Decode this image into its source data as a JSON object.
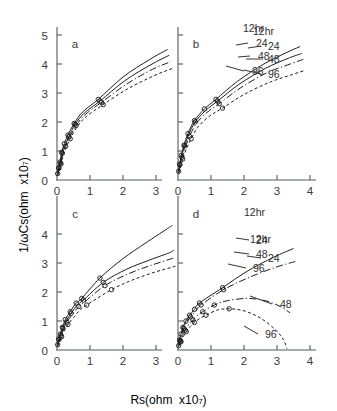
{
  "figure": {
    "title": "",
    "xlabel_parts": {
      "main": "Rs(ohm  x10",
      "exp": "7",
      "close": ")"
    },
    "ylabel_parts": {
      "main": "1/ωCs(ohm  x10",
      "exp": "7",
      "close": ")"
    },
    "panels": [
      {
        "id": "a",
        "letter": "a"
      },
      {
        "id": "b",
        "letter": "b"
      },
      {
        "id": "c",
        "letter": "c"
      },
      {
        "id": "d",
        "letter": "d"
      }
    ],
    "series_labels": [
      "12hr",
      "24",
      "48",
      "96"
    ],
    "xticks_top_left": [
      "0",
      "1",
      "2",
      "3"
    ],
    "xticks_top_right": [
      "0",
      "1",
      "2",
      "3",
      "4"
    ],
    "xticks_bottom_left": [
      "0",
      "1",
      "2",
      "3"
    ],
    "xticks_bottom_right": [
      "0",
      "1",
      "2",
      "3",
      "4"
    ],
    "yticks_top": [
      "0",
      "1",
      "2",
      "3",
      "4",
      "5"
    ],
    "yticks_bottom": [
      "0",
      "1",
      "2",
      "3",
      "4"
    ]
  },
  "chart_data": {
    "type": "line",
    "title": "",
    "xlabel": "Rs(ohm x10^7)",
    "ylabel": "1/ωCs(ohm x10^7)",
    "grid": false,
    "legend_position": "inline-right-of-curves",
    "subplots": [
      {
        "panel": "a",
        "xlim": [
          0,
          3.6
        ],
        "ylim": [
          0,
          5
        ],
        "series": [
          {
            "name": "12hr",
            "style": "solid",
            "x": [
              0.02,
              0.05,
              0.09,
              0.14,
              0.22,
              0.33,
              0.52,
              0.78,
              1.25,
              2.0,
              2.8,
              3.35
            ],
            "y": [
              0.22,
              0.42,
              0.62,
              0.95,
              1.25,
              1.55,
              1.95,
              2.35,
              2.78,
              3.55,
              4.15,
              4.5
            ],
            "markers_x": [
              0.02,
              0.05,
              0.09,
              0.14,
              0.22,
              0.33,
              0.52,
              1.25
            ],
            "markers_y": [
              0.22,
              0.42,
              0.62,
              0.95,
              1.25,
              1.55,
              1.95,
              2.78
            ]
          },
          {
            "name": "24",
            "style": "solid",
            "x": [
              0.02,
              0.06,
              0.1,
              0.16,
              0.25,
              0.36,
              0.55,
              0.82,
              1.3,
              2.05,
              2.85,
              3.4
            ],
            "y": [
              0.2,
              0.4,
              0.6,
              0.92,
              1.2,
              1.5,
              1.92,
              2.3,
              2.72,
              3.42,
              3.98,
              4.3
            ],
            "markers_x": [
              0.06,
              0.16,
              0.36,
              0.55,
              1.3
            ],
            "markers_y": [
              0.4,
              0.92,
              1.5,
              1.92,
              2.72
            ]
          },
          {
            "name": "48",
            "style": "dashdot",
            "x": [
              0.02,
              0.06,
              0.11,
              0.17,
              0.26,
              0.38,
              0.58,
              0.85,
              1.35,
              2.1,
              2.9,
              3.45
            ],
            "y": [
              0.18,
              0.38,
              0.58,
              0.88,
              1.16,
              1.46,
              1.88,
              2.25,
              2.68,
              3.3,
              3.82,
              4.08
            ],
            "markers_x": [
              0.11,
              0.26,
              0.58,
              1.35
            ],
            "markers_y": [
              0.58,
              1.16,
              1.88,
              2.68
            ]
          },
          {
            "name": "96",
            "style": "dash",
            "x": [
              0.02,
              0.07,
              0.12,
              0.19,
              0.28,
              0.4,
              0.6,
              0.88,
              1.4,
              2.15,
              2.95,
              3.5
            ],
            "y": [
              0.16,
              0.35,
              0.55,
              0.85,
              1.12,
              1.42,
              1.82,
              2.18,
              2.6,
              3.15,
              3.6,
              3.85
            ],
            "markers_x": [
              0.12,
              0.4,
              1.4
            ],
            "markers_y": [
              0.55,
              1.42,
              2.6
            ]
          }
        ]
      },
      {
        "panel": "b",
        "xlim": [
          0,
          4
        ],
        "ylim": [
          0,
          5
        ],
        "series": [
          {
            "name": "12hr",
            "style": "solid",
            "x": [
              0.02,
              0.05,
              0.1,
              0.18,
              0.3,
              0.5,
              0.8,
              1.15,
              1.8,
              2.6,
              3.3,
              3.7
            ],
            "y": [
              0.3,
              0.55,
              0.85,
              1.2,
              1.6,
              2.05,
              2.45,
              2.78,
              3.4,
              4.0,
              4.4,
              4.6
            ],
            "markers_x": [
              0.02,
              0.05,
              0.1,
              0.18,
              0.3,
              0.5,
              0.8,
              1.15
            ],
            "markers_y": [
              0.3,
              0.55,
              0.85,
              1.2,
              1.6,
              2.05,
              2.45,
              2.78
            ]
          },
          {
            "name": "24",
            "style": "solid",
            "x": [
              0.02,
              0.06,
              0.11,
              0.2,
              0.32,
              0.52,
              0.84,
              1.2,
              1.85,
              2.65,
              3.35,
              3.75
            ],
            "y": [
              0.28,
              0.52,
              0.82,
              1.17,
              1.56,
              2.0,
              2.4,
              2.72,
              3.3,
              3.85,
              4.2,
              4.36
            ],
            "markers_x": [
              0.06,
              0.2,
              0.52,
              1.2
            ],
            "markers_y": [
              0.52,
              1.17,
              2.0,
              2.72
            ]
          },
          {
            "name": "48",
            "style": "dashdot",
            "x": [
              0.02,
              0.07,
              0.12,
              0.22,
              0.35,
              0.55,
              0.88,
              1.25,
              1.9,
              2.7,
              3.4,
              3.8
            ],
            "y": [
              0.26,
              0.5,
              0.78,
              1.13,
              1.5,
              1.94,
              2.33,
              2.63,
              3.18,
              3.7,
              4.0,
              4.16
            ],
            "markers_x": [
              0.12,
              0.35,
              1.25
            ],
            "markers_y": [
              0.78,
              1.5,
              2.63
            ]
          },
          {
            "name": "96",
            "style": "dash",
            "x": [
              0.02,
              0.08,
              0.14,
              0.25,
              0.4,
              0.6,
              0.95,
              1.35,
              2.0,
              2.8,
              3.5,
              3.85
            ],
            "y": [
              0.24,
              0.46,
              0.72,
              1.06,
              1.42,
              1.82,
              2.2,
              2.48,
              2.95,
              3.38,
              3.65,
              3.78
            ],
            "markers_x": [
              0.14,
              0.4,
              1.35
            ],
            "markers_y": [
              0.72,
              1.42,
              2.48
            ]
          }
        ]
      },
      {
        "panel": "c",
        "xlim": [
          0,
          3.6
        ],
        "ylim": [
          0,
          4.6
        ],
        "series": [
          {
            "name": "12hr",
            "style": "solid",
            "x": [
              0.02,
              0.05,
              0.1,
              0.16,
              0.25,
              0.4,
              0.58,
              0.75,
              1.3,
              2.0,
              2.7,
              3.3,
              3.5
            ],
            "y": [
              0.18,
              0.38,
              0.55,
              0.78,
              1.05,
              1.32,
              1.62,
              1.78,
              2.48,
              3.15,
              3.7,
              4.15,
              4.3
            ],
            "markers_x": [
              0.02,
              0.05,
              0.1,
              0.16,
              0.25,
              0.4,
              0.58,
              0.75,
              1.3
            ],
            "markers_y": [
              0.18,
              0.38,
              0.55,
              0.78,
              1.05,
              1.32,
              1.62,
              1.78,
              2.48
            ]
          },
          {
            "name": "24",
            "style": "solid",
            "x": [
              0.02,
              0.06,
              0.11,
              0.18,
              0.28,
              0.43,
              0.62,
              0.8,
              1.4,
              2.1,
              2.8,
              3.4,
              3.55
            ],
            "y": [
              0.16,
              0.36,
              0.52,
              0.75,
              1.0,
              1.27,
              1.56,
              1.72,
              2.33,
              2.78,
              3.1,
              3.35,
              3.45
            ],
            "markers_x": [
              0.06,
              0.18,
              0.43,
              0.8,
              1.4
            ],
            "markers_y": [
              0.36,
              0.75,
              1.27,
              1.72,
              2.33
            ]
          },
          {
            "name": "48",
            "style": "dashdot",
            "x": [
              0.02,
              0.07,
              0.12,
              0.2,
              0.3,
              0.46,
              0.66,
              0.84,
              1.45,
              2.15,
              2.85,
              3.45,
              3.58
            ],
            "y": [
              0.15,
              0.34,
              0.5,
              0.72,
              0.96,
              1.22,
              1.5,
              1.66,
              2.22,
              2.62,
              2.92,
              3.14,
              3.2
            ],
            "markers_x": [
              0.12,
              0.3,
              0.66,
              1.45
            ],
            "markers_y": [
              0.5,
              0.96,
              1.5,
              2.22
            ]
          },
          {
            "name": "96",
            "style": "dash",
            "x": [
              0.02,
              0.08,
              0.14,
              0.22,
              0.33,
              0.5,
              0.7,
              0.9,
              1.65,
              2.3,
              2.95,
              3.5,
              3.6
            ],
            "y": [
              0.13,
              0.3,
              0.46,
              0.66,
              0.88,
              1.12,
              1.38,
              1.55,
              2.08,
              2.42,
              2.68,
              2.86,
              2.9
            ],
            "markers_x": [
              0.14,
              0.33,
              0.9,
              1.65
            ],
            "markers_y": [
              0.46,
              0.88,
              1.55,
              2.08
            ]
          }
        ]
      },
      {
        "panel": "d",
        "xlim": [
          0,
          4
        ],
        "ylim": [
          0,
          4.6
        ],
        "series": [
          {
            "name": "12hr",
            "style": "solid",
            "x": [
              0.02,
              0.05,
              0.09,
              0.15,
              0.24,
              0.35,
              0.5,
              0.65,
              1.35,
              2.1,
              2.9,
              3.5
            ],
            "y": [
              0.15,
              0.35,
              0.55,
              0.78,
              1.0,
              1.2,
              1.4,
              1.62,
              2.15,
              2.72,
              3.2,
              3.5
            ],
            "markers_x": [
              0.02,
              0.05,
              0.09,
              0.15,
              0.24,
              0.35,
              0.5,
              0.65,
              1.35
            ],
            "markers_y": [
              0.15,
              0.35,
              0.55,
              0.78,
              1.0,
              1.2,
              1.4,
              1.62,
              2.15
            ]
          },
          {
            "name": "24",
            "style": "dashdot",
            "x": [
              0.02,
              0.06,
              0.1,
              0.17,
              0.26,
              0.38,
              0.54,
              0.7,
              1.38,
              2.15,
              2.95,
              3.55
            ],
            "y": [
              0.14,
              0.33,
              0.52,
              0.74,
              0.95,
              1.14,
              1.34,
              1.55,
              2.08,
              2.5,
              2.85,
              3.05
            ],
            "markers_x": [
              0.06,
              0.17,
              0.38,
              0.7,
              1.38
            ],
            "markers_y": [
              0.33,
              0.74,
              1.14,
              1.55,
              2.08
            ]
          },
          {
            "name": "48",
            "style": "dashdot",
            "x": [
              0.02,
              0.08,
              0.14,
              0.22,
              0.32,
              0.45,
              0.6,
              0.75,
              1.1,
              1.5,
              2.1,
              2.65,
              3.1,
              3.4
            ],
            "y": [
              0.13,
              0.3,
              0.48,
              0.68,
              0.88,
              1.04,
              1.2,
              1.32,
              1.55,
              1.7,
              1.78,
              1.7,
              1.5,
              1.28
            ],
            "markers_x": [
              0.08,
              0.22,
              0.45,
              0.75,
              1.1
            ],
            "markers_y": [
              0.3,
              0.68,
              1.04,
              1.32,
              1.55
            ]
          },
          {
            "name": "96",
            "style": "dash",
            "x": [
              0.02,
              0.09,
              0.16,
              0.25,
              0.36,
              0.5,
              0.65,
              0.85,
              1.2,
              1.55,
              2.0,
              2.5,
              2.95,
              3.2,
              3.3
            ],
            "y": [
              0.12,
              0.28,
              0.45,
              0.63,
              0.8,
              0.95,
              1.08,
              1.2,
              1.38,
              1.42,
              1.35,
              1.1,
              0.7,
              0.35,
              0.05
            ],
            "markers_x": [
              0.09,
              0.25,
              0.5,
              0.85,
              1.55
            ],
            "markers_y": [
              0.28,
              0.63,
              0.95,
              1.2,
              1.42
            ]
          }
        ]
      }
    ]
  },
  "annotations": {
    "a": [
      {
        "label": "12hr",
        "x": 243,
        "y": 32
      },
      {
        "label": "24",
        "x": 256,
        "y": 47
      },
      {
        "label": "48",
        "x": 258,
        "y": 60
      },
      {
        "label": "96",
        "x": 252,
        "y": 75
      }
    ],
    "b": [
      {
        "label": "12hr",
        "x": 253,
        "y": 35
      },
      {
        "label": "24",
        "x": 268,
        "y": 50
      },
      {
        "label": "48",
        "x": 268,
        "y": 63
      },
      {
        "label": "96",
        "x": 268,
        "y": 78
      }
    ],
    "c": [
      {
        "label": "12hr",
        "x": 244,
        "y": 216
      },
      {
        "label": "24",
        "x": 256,
        "y": 244
      },
      {
        "label": "48",
        "x": 256,
        "y": 258
      },
      {
        "label": "96",
        "x": 253,
        "y": 272
      }
    ],
    "d": [
      {
        "label": "12hr",
        "x": 250,
        "y": 243
      },
      {
        "label": "24",
        "x": 268,
        "y": 262
      },
      {
        "label": "48",
        "x": 280,
        "y": 308
      },
      {
        "label": "96",
        "x": 265,
        "y": 338
      }
    ]
  }
}
